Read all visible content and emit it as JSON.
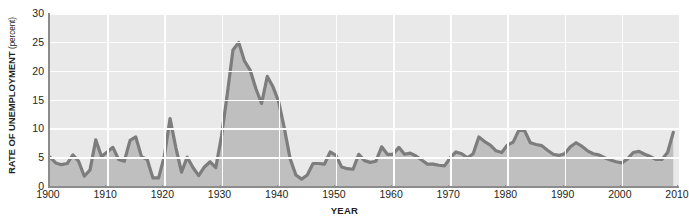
{
  "chart_data": {
    "type": "area",
    "title": "",
    "xlabel": "YEAR",
    "ylabel": "RATE OF UNEMPLOYMENT",
    "ylabel_unit": "(percent)",
    "xlim": [
      1900,
      2010
    ],
    "ylim": [
      0,
      30
    ],
    "ytick_labels": [
      "0",
      "5",
      "10",
      "15",
      "20",
      "25",
      "30"
    ],
    "ytick_values": [
      0,
      5,
      10,
      15,
      20,
      25,
      30
    ],
    "xtick_labels": [
      "1900",
      "1910",
      "1920",
      "1930",
      "1940",
      "1950",
      "1960",
      "1970",
      "1980",
      "1990",
      "2000",
      "2010"
    ],
    "xtick_values": [
      1900,
      1910,
      1920,
      1930,
      1940,
      1950,
      1960,
      1970,
      1980,
      1990,
      2000,
      2010
    ],
    "grid": true,
    "legend": "none",
    "series": [
      {
        "name": "Rate of unemployment",
        "line_color": "#7d7d7d",
        "fill_color": "#bfbfbf",
        "x": [
          1900,
          1901,
          1902,
          1903,
          1904,
          1905,
          1906,
          1907,
          1908,
          1909,
          1910,
          1911,
          1912,
          1913,
          1914,
          1915,
          1916,
          1917,
          1918,
          1919,
          1920,
          1921,
          1922,
          1923,
          1924,
          1925,
          1926,
          1927,
          1928,
          1929,
          1930,
          1931,
          1932,
          1933,
          1934,
          1935,
          1936,
          1937,
          1938,
          1939,
          1940,
          1941,
          1942,
          1943,
          1944,
          1945,
          1946,
          1947,
          1948,
          1949,
          1950,
          1951,
          1952,
          1953,
          1954,
          1955,
          1956,
          1957,
          1958,
          1959,
          1960,
          1961,
          1962,
          1963,
          1964,
          1965,
          1966,
          1967,
          1968,
          1969,
          1970,
          1971,
          1972,
          1973,
          1974,
          1975,
          1976,
          1977,
          1978,
          1979,
          1980,
          1981,
          1982,
          1983,
          1984,
          1985,
          1986,
          1987,
          1988,
          1989,
          1990,
          1991,
          1992,
          1993,
          1994,
          1995,
          1996,
          1997,
          1998,
          1999,
          2000,
          2001,
          2002,
          2003,
          2004,
          2005,
          2006,
          2007,
          2008,
          2009
        ],
        "values": [
          5.0,
          4.0,
          3.7,
          3.9,
          5.4,
          4.3,
          1.7,
          2.8,
          8.0,
          5.1,
          5.9,
          6.7,
          4.6,
          4.3,
          7.9,
          8.5,
          5.1,
          4.6,
          1.4,
          1.4,
          5.2,
          11.7,
          6.7,
          2.4,
          5.0,
          3.2,
          1.8,
          3.3,
          4.2,
          3.2,
          8.7,
          15.9,
          23.6,
          24.9,
          21.7,
          20.1,
          16.9,
          14.3,
          19.0,
          17.2,
          14.6,
          9.9,
          4.7,
          1.9,
          1.2,
          1.9,
          3.9,
          3.9,
          3.8,
          5.9,
          5.3,
          3.3,
          3.0,
          2.9,
          5.5,
          4.4,
          4.1,
          4.3,
          6.8,
          5.5,
          5.5,
          6.7,
          5.5,
          5.7,
          5.2,
          4.5,
          3.8,
          3.8,
          3.6,
          3.5,
          4.9,
          5.9,
          5.6,
          4.9,
          5.6,
          8.5,
          7.7,
          7.1,
          6.1,
          5.8,
          7.1,
          7.6,
          9.7,
          9.6,
          7.5,
          7.2,
          7.0,
          6.2,
          5.5,
          5.3,
          5.6,
          6.8,
          7.5,
          6.9,
          6.1,
          5.6,
          5.4,
          4.9,
          4.5,
          4.2,
          4.0,
          4.7,
          5.8,
          6.0,
          5.5,
          5.1,
          4.6,
          4.6,
          5.8,
          9.3
        ]
      }
    ]
  }
}
